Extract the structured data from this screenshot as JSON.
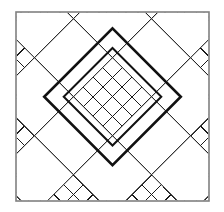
{
  "figure": {
    "canvas": {
      "width": 224,
      "height": 212
    },
    "background_color": "#ffffff"
  },
  "border": {
    "name": "outer-square-border",
    "x": 16,
    "y": 12,
    "width": 193,
    "height": 189,
    "stroke_color": "#808080",
    "stroke_width": 1.6,
    "fill": "#ffffff"
  },
  "lattice": {
    "name": "diamond-lattice",
    "cell_pitch": 13.8,
    "rotation_degrees": 45,
    "stroke_color": "#1a1a1a",
    "stroke_width": 1.0,
    "columns": 14,
    "rows": 14
  },
  "plain_diamonds": {
    "name": "large-plain-diamonds",
    "size_in_cells": 4,
    "stroke_color": "#1a1a1a",
    "stroke_width": 1.0,
    "fill": "#ffffff",
    "centers_uv": [
      [
        2,
        2
      ],
      [
        6,
        2
      ],
      [
        10,
        2
      ],
      [
        2,
        6
      ],
      [
        10,
        6
      ],
      [
        2,
        10
      ],
      [
        6,
        10
      ],
      [
        10,
        10
      ],
      [
        6,
        -2
      ],
      [
        -2,
        6
      ],
      [
        14,
        6
      ],
      [
        6,
        14
      ]
    ]
  },
  "bold_diamond": {
    "name": "center-bold-diamond",
    "center_uv": [
      6,
      6
    ],
    "half_size_in_cells": 3.5,
    "stroke_color": "#111111",
    "stroke_width": 2.6,
    "fill": "none",
    "inner_offset_cells": 1.0,
    "inner_stroke_width": 2.0
  },
  "chart_data": {
    "type": "diagram",
    "elements": [
      {
        "label": "outer border",
        "count": 1
      },
      {
        "label": "small lattice diamonds",
        "count": 196
      },
      {
        "label": "large plain diamonds",
        "count": 12
      },
      {
        "label": "bold center diamond rings",
        "count": 2
      }
    ]
  }
}
